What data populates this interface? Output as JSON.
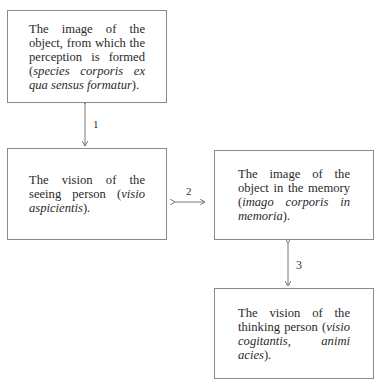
{
  "top_cut_text": "",
  "boxes": {
    "object_image": {
      "text_plain": "The image of the object, from which the perception is formed (",
      "text_italic": "species corporis ex qua sensus formatur",
      "text_end": ")."
    },
    "seeing_vision": {
      "text_plain": "The vision of the seeing person (",
      "text_italic": "visio aspicientis",
      "text_end": ")."
    },
    "memory_image": {
      "text_plain": "The image of the object in the memory (",
      "text_italic": "imago corporis in memoria",
      "text_end": ")."
    },
    "thinking_vision": {
      "text_plain": "The vision of the thinking person (",
      "text_italic": "visio cogitantis, animi acies",
      "text_end": ")."
    }
  },
  "arrows": [
    {
      "label": "1",
      "from": "object_image",
      "to": "seeing_vision",
      "direction": "bidirectional"
    },
    {
      "label": "2",
      "from": "seeing_vision",
      "to": "memory_image",
      "direction": "bidirectional"
    },
    {
      "label": "3",
      "from": "memory_image",
      "to": "thinking_vision",
      "direction": "bidirectional"
    }
  ],
  "colors": {
    "border": "#8a8a8a",
    "arrow": "#777777",
    "text": "#2a2a2a"
  }
}
